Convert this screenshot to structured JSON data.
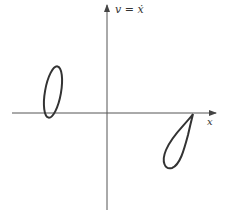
{
  "diagram": {
    "type": "phase-plane",
    "y_axis_label": "v = ẋ",
    "x_axis_label": "x",
    "curves": [
      {
        "name": "closed-orbit",
        "shape": "ellipse",
        "quadrant": "left of v-axis, crossing x-axis"
      },
      {
        "name": "homoclinic-loop",
        "shape": "teardrop",
        "quadrant": "right, below x-axis, tip on x-axis"
      }
    ],
    "stroke_color": "#333333"
  }
}
